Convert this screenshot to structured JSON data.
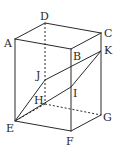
{
  "figure": {
    "type": "rectangular-prism",
    "vertices": {
      "A": {
        "x": 15,
        "y": 39
      },
      "B": {
        "x": 71,
        "y": 49
      },
      "C": {
        "x": 101,
        "y": 33
      },
      "D": {
        "x": 45,
        "y": 23
      },
      "E": {
        "x": 15,
        "y": 121
      },
      "F": {
        "x": 71,
        "y": 131
      },
      "G": {
        "x": 101,
        "y": 115
      },
      "H": {
        "x": 45,
        "y": 104
      },
      "I": {
        "x": 71,
        "y": 87
      },
      "J": {
        "x": 45,
        "y": 80
      },
      "K": {
        "x": 101,
        "y": 51
      }
    },
    "labels": {
      "A": "A",
      "B": "B",
      "C": "C",
      "D": "D",
      "E": "E",
      "F": "F",
      "G": "G",
      "H": "H",
      "I": "I",
      "J": "J",
      "K": "K"
    },
    "visible_edges": [
      [
        "A",
        "D"
      ],
      [
        "D",
        "C"
      ],
      [
        "C",
        "B"
      ],
      [
        "B",
        "A"
      ],
      [
        "A",
        "E"
      ],
      [
        "B",
        "F"
      ],
      [
        "C",
        "G"
      ],
      [
        "E",
        "F"
      ],
      [
        "F",
        "G"
      ]
    ],
    "hidden_edges": [
      [
        "D",
        "H"
      ],
      [
        "H",
        "E"
      ],
      [
        "H",
        "G"
      ]
    ],
    "section_edges": [
      [
        "E",
        "J"
      ],
      [
        "J",
        "K"
      ],
      [
        "K",
        "I"
      ],
      [
        "I",
        "E"
      ]
    ]
  }
}
